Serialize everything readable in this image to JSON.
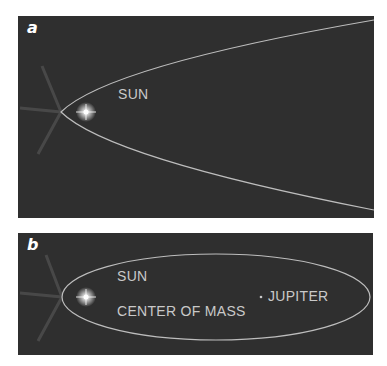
{
  "panels": {
    "a": {
      "label": "a",
      "sun_label": "SUN",
      "orbit": "parabola"
    },
    "b": {
      "label": "b",
      "sun_label": "SUN",
      "center_of_mass_label": "CENTER OF MASS",
      "jupiter_label": "JUPITER",
      "orbit": "ellipse"
    }
  },
  "colors": {
    "background": "#2f2f2f",
    "orbit_line": "#bdbdbd",
    "text": "#c9c9c9",
    "sun": "#ffffff"
  }
}
